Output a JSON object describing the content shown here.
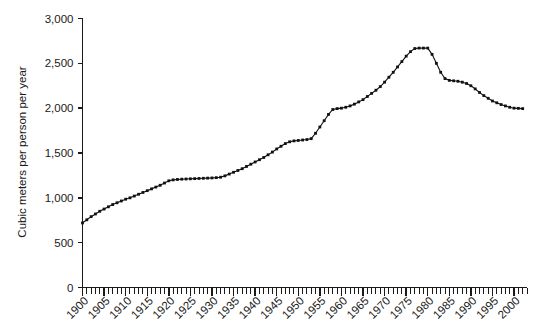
{
  "chart_data": {
    "type": "line",
    "title": "",
    "subtitle": "",
    "xlabel": "",
    "ylabel": "Cubic meters per person per year",
    "xlim": [
      1900,
      2003
    ],
    "ylim": [
      0,
      3000
    ],
    "grid": false,
    "legend": false,
    "legend_position": "none",
    "marker": "filled-square-dot",
    "line_color": "#111111",
    "y_ticks": [
      0,
      500,
      1000,
      1500,
      2000,
      2500,
      3000
    ],
    "y_tick_labels": [
      "0",
      "500",
      "1,000",
      "1,500",
      "2,000",
      "2,500",
      "3,000"
    ],
    "x_ticks": [
      1900,
      1905,
      1910,
      1915,
      1920,
      1925,
      1930,
      1935,
      1940,
      1945,
      1950,
      1955,
      1960,
      1965,
      1970,
      1975,
      1980,
      1985,
      1990,
      1995,
      2000
    ],
    "x_tick_labels": [
      "1900",
      "1905",
      "1910",
      "1915",
      "1920",
      "1925",
      "1930",
      "1935",
      "1940",
      "1945",
      "1950",
      "1955",
      "1960",
      "1965",
      "1970",
      "1975",
      "1980",
      "1985",
      "1990",
      "1995",
      "2000"
    ],
    "x_minor_tick_interval": 1,
    "x": [
      1900,
      1901,
      1902,
      1903,
      1904,
      1905,
      1906,
      1907,
      1908,
      1909,
      1910,
      1911,
      1912,
      1913,
      1914,
      1915,
      1916,
      1917,
      1918,
      1919,
      1920,
      1921,
      1922,
      1923,
      1924,
      1925,
      1926,
      1927,
      1928,
      1929,
      1930,
      1931,
      1932,
      1933,
      1934,
      1935,
      1936,
      1937,
      1938,
      1939,
      1940,
      1941,
      1942,
      1943,
      1944,
      1945,
      1946,
      1947,
      1948,
      1949,
      1950,
      1951,
      1952,
      1953,
      1954,
      1955,
      1956,
      1957,
      1958,
      1959,
      1960,
      1961,
      1962,
      1963,
      1964,
      1965,
      1966,
      1967,
      1968,
      1969,
      1970,
      1971,
      1972,
      1973,
      1974,
      1975,
      1976,
      1977,
      1978,
      1979,
      1980,
      1981,
      1982,
      1983,
      1984,
      1985,
      1986,
      1987,
      1988,
      1989,
      1990,
      1991,
      1992,
      1993,
      1994,
      1995,
      1996,
      1997,
      1998,
      1999,
      2000,
      2001,
      2002
    ],
    "values": [
      720,
      755,
      790,
      820,
      850,
      875,
      900,
      925,
      945,
      965,
      985,
      1000,
      1020,
      1040,
      1060,
      1080,
      1100,
      1120,
      1140,
      1165,
      1190,
      1200,
      1205,
      1208,
      1210,
      1212,
      1214,
      1216,
      1218,
      1220,
      1222,
      1225,
      1230,
      1245,
      1265,
      1285,
      1305,
      1325,
      1350,
      1375,
      1400,
      1425,
      1450,
      1480,
      1510,
      1545,
      1575,
      1605,
      1625,
      1635,
      1640,
      1645,
      1650,
      1660,
      1720,
      1790,
      1860,
      1930,
      1985,
      1995,
      2000,
      2010,
      2025,
      2045,
      2070,
      2095,
      2130,
      2165,
      2200,
      2240,
      2290,
      2345,
      2400,
      2460,
      2520,
      2580,
      2630,
      2665,
      2670,
      2670,
      2670,
      2600,
      2500,
      2400,
      2330,
      2310,
      2305,
      2300,
      2290,
      2275,
      2250,
      2215,
      2175,
      2140,
      2110,
      2080,
      2060,
      2040,
      2025,
      2010,
      2000,
      1998,
      1995
    ]
  }
}
